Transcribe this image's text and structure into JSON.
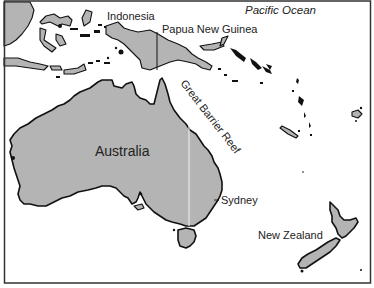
{
  "map": {
    "type": "regional political/physical map",
    "region": "Australia and Oceania",
    "colors": {
      "land": "#b4b4b4",
      "water": "#ffffff",
      "coastline": "#111111",
      "frame": "#333333"
    },
    "labels": {
      "pacific_ocean": "Pacific Ocean",
      "indonesia": "Indonesia",
      "papua_new_guinea": "Papua New Guinea",
      "great_barrier_reef": "Great Barrier Reef",
      "australia": "Australia",
      "sydney": "Sydney",
      "new_zealand": "New Zealand"
    },
    "features": [
      {
        "name": "Australia",
        "kind": "country/continent"
      },
      {
        "name": "Indonesia",
        "kind": "country"
      },
      {
        "name": "Papua New Guinea",
        "kind": "country"
      },
      {
        "name": "New Zealand",
        "kind": "country"
      },
      {
        "name": "Sydney",
        "kind": "city",
        "marker": "leader-line"
      },
      {
        "name": "Great Barrier Reef",
        "kind": "physical feature"
      },
      {
        "name": "Pacific Ocean",
        "kind": "water body"
      }
    ]
  }
}
